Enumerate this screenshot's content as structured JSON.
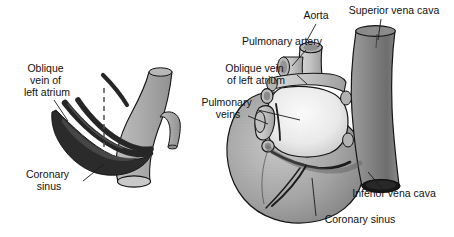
{
  "figure": {
    "background_color": "#ffffff",
    "panels": [
      {
        "id": "left-panel",
        "name": "isolated-coronary-sinus-schematic",
        "description": "Schematic of the coronary sinus and oblique vein of left atrium joining the inferior vena cava",
        "labels": [
          {
            "id": "oblique-vein-left-atrium",
            "lines": [
              "Oblique",
              "vein of",
              "left atrium"
            ],
            "x": 47,
            "y": 72,
            "anchor": "middle"
          },
          {
            "id": "coronary-sinus",
            "lines": [
              "Coronary",
              "sinus"
            ],
            "x": 49,
            "y": 178,
            "anchor": "middle"
          }
        ]
      },
      {
        "id": "right-panel",
        "name": "posterior-heart-view",
        "description": "Posterior view of the heart showing great vessels and the coronary sinus",
        "labels": [
          {
            "id": "aorta",
            "lines": [
              "Aorta"
            ],
            "x": 316,
            "y": 19,
            "anchor": "middle"
          },
          {
            "id": "superior-vena-cava",
            "lines": [
              "Superior vena cava"
            ],
            "x": 394,
            "y": 14,
            "anchor": "middle"
          },
          {
            "id": "pulmonary-artery",
            "lines": [
              "Pulmonary artery"
            ],
            "x": 282,
            "y": 45,
            "anchor": "middle"
          },
          {
            "id": "oblique-vein-left-atrium-2",
            "lines": [
              "Oblique vein",
              "of left atrium"
            ],
            "x": 256,
            "y": 72,
            "anchor": "middle"
          },
          {
            "id": "pulmonary-veins",
            "lines": [
              "Pulmonary",
              "veins"
            ],
            "x": 228,
            "y": 106,
            "anchor": "middle"
          },
          {
            "id": "inferior-vena-cava",
            "lines": [
              "Inferior vena cava"
            ],
            "x": 394,
            "y": 197,
            "anchor": "middle"
          },
          {
            "id": "coronary-sinus-2",
            "lines": [
              "Coronary sinus"
            ],
            "x": 360,
            "y": 223,
            "anchor": "middle"
          }
        ]
      }
    ],
    "colors": {
      "background": "#ffffff",
      "text": "#111111",
      "leader_line": "#1a1a1a",
      "outline": "#141414",
      "vessel_light_gray": "#a8a8a8",
      "vessel_mid_gray": "#8f8f8f",
      "vessel_dark_gray": "#6f6f6f",
      "coronary_sinus_dark": "#2b2b2b",
      "heart_body_gray": "#9a9a9a",
      "atrium_light": "#e9e9e9",
      "cut_lumen": "#141414"
    }
  }
}
